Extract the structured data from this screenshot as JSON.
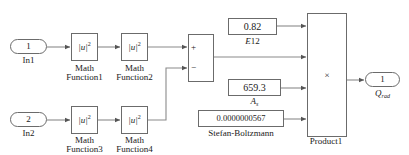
{
  "diagram": {
    "wire_color": "#8a8a8a",
    "border_color": "#6b6b6b",
    "text_color": "#1a1a1a"
  },
  "inputs": [
    {
      "port_number": "1",
      "label": "In1"
    },
    {
      "port_number": "2",
      "label": "In2"
    }
  ],
  "math_functions": [
    {
      "expr_base": "|u|",
      "expr_exp": "2",
      "caption_line1": "Math",
      "caption_line2": "Function1"
    },
    {
      "expr_base": "|u|",
      "expr_exp": "2",
      "caption_line1": "Math",
      "caption_line2": "Function2"
    },
    {
      "expr_base": "|u|",
      "expr_exp": "2",
      "caption_line1": "Math",
      "caption_line2": "Function3"
    },
    {
      "expr_base": "|u|",
      "expr_exp": "2",
      "caption_line1": "Math",
      "caption_line2": "Function4"
    }
  ],
  "sum_block": {
    "plus_sign": "+",
    "minus_sign": "−"
  },
  "constants": [
    {
      "value": "0.82",
      "caption_var": "E",
      "caption_sub": "12"
    },
    {
      "value": "659.3",
      "caption_var": "A",
      "caption_sub": "s"
    },
    {
      "value": "0.0000000567",
      "caption_var": "Stefan-Boltzmann",
      "caption_sub": ""
    }
  ],
  "product_block": {
    "operator": "×",
    "caption": "Product1"
  },
  "output": {
    "port_number": "1",
    "label_var": "Q",
    "label_sub": "rad"
  }
}
